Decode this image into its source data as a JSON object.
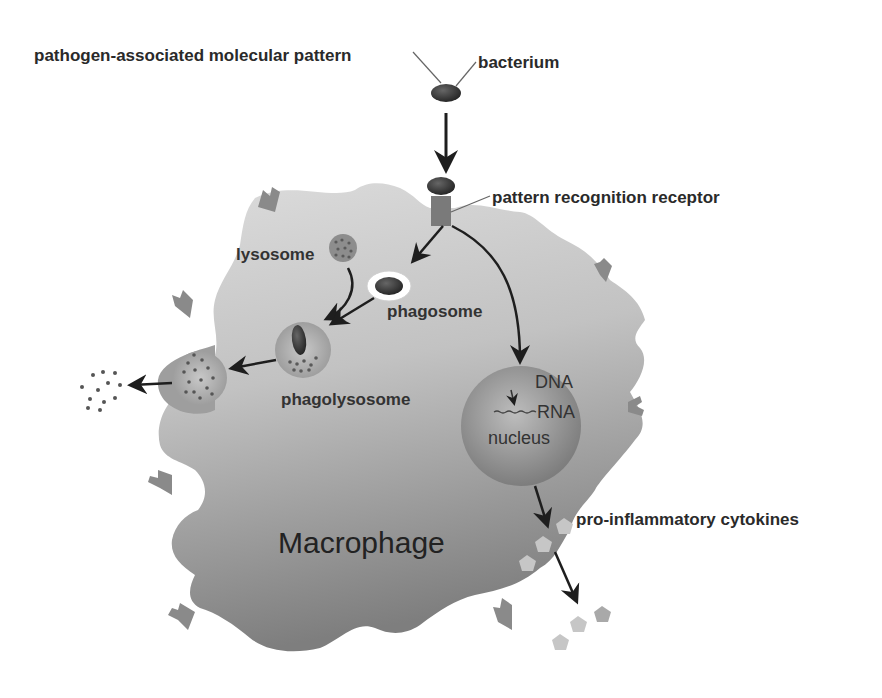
{
  "labels": {
    "pamp": "pathogen-associated molecular pattern",
    "bacterium": "bacterium",
    "prr": "pattern recognition receptor",
    "lysosome": "lysosome",
    "phagosome": "phagosome",
    "phagolysosome": "phagolysosome",
    "dna": "DNA",
    "rna": "RNA",
    "nucleus": "nucleus",
    "cytokines": "pro-inflammatory cytokines",
    "cell": "Macrophage"
  },
  "colors": {
    "background": "#ffffff",
    "cell_light": "#d6d6d6",
    "cell_dark": "#8c8c8c",
    "receptor": "#7a7a7a",
    "bacterium": "#3a3a3a",
    "nucleus": "#9a9a9a",
    "cytokine": "#c4c4c4",
    "arrow": "#1e1e1e",
    "text": "#2a2a2a"
  },
  "flow": [
    {
      "from": "bacterium",
      "to": "pattern recognition receptor"
    },
    {
      "from": "pattern recognition receptor",
      "to": "phagosome"
    },
    {
      "from": "pattern recognition receptor",
      "to": "nucleus"
    },
    {
      "from": "lysosome",
      "to": "phagolysosome"
    },
    {
      "from": "phagosome",
      "to": "phagolysosome"
    },
    {
      "from": "phagolysosome",
      "to": "exocytosis vesicle"
    },
    {
      "from": "exocytosis vesicle",
      "to": "released debris"
    },
    {
      "from": "nucleus",
      "to": "pro-inflammatory cytokines"
    }
  ]
}
